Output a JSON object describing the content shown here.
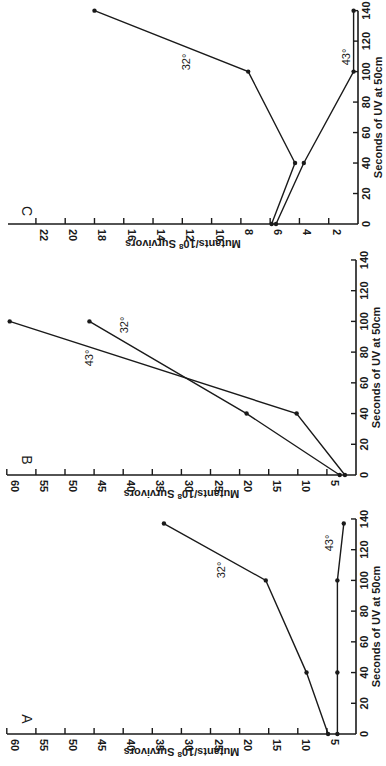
{
  "figure": {
    "orientation": "rotated 90 degrees clockwise",
    "colors": {
      "ink": "#1a1a1a",
      "background": "#ffffff"
    }
  },
  "chart_data": [
    {
      "panel": "A",
      "type": "line",
      "title": "A",
      "xlabel": "Seconds of UV at 50cm",
      "ylabel": "Mutants/10^8 Survivors",
      "ylabel_display": {
        "main": "Mutants/10",
        "sup": "8",
        "rest": " Survivors"
      },
      "xlim": [
        0,
        140
      ],
      "ylim": [
        0,
        60
      ],
      "xticks": [
        0,
        20,
        40,
        60,
        80,
        100,
        120,
        140
      ],
      "yticks": [
        5,
        10,
        15,
        20,
        25,
        30,
        35,
        40,
        45,
        50,
        55,
        60
      ],
      "grid": false,
      "series": [
        {
          "name": "32°",
          "x": [
            0,
            40,
            100,
            137
          ],
          "y": [
            4.8,
            8.5,
            15.5,
            33
          ]
        },
        {
          "name": "43°",
          "x": [
            0,
            40,
            100,
            137
          ],
          "y": [
            3.2,
            3.2,
            3.2,
            2.1
          ]
        }
      ]
    },
    {
      "panel": "B",
      "type": "line",
      "title": "B",
      "xlabel": "Seconds of UV at 50cm",
      "ylabel": "Mutants/10^8 Survivors",
      "ylabel_display": {
        "main": "Mutants/10",
        "sup": "8",
        "rest": " Survivors"
      },
      "xlim": [
        0,
        140
      ],
      "ylim": [
        0,
        60
      ],
      "xticks": [
        0,
        20,
        40,
        60,
        80,
        100,
        120,
        140
      ],
      "yticks": [
        5,
        10,
        15,
        20,
        25,
        30,
        35,
        40,
        45,
        50,
        55,
        60
      ],
      "grid": false,
      "series": [
        {
          "name": "32°",
          "x": [
            0,
            40,
            100
          ],
          "y": [
            2.8,
            18.8,
            45.8
          ]
        },
        {
          "name": "43°",
          "x": [
            0,
            40,
            100
          ],
          "y": [
            1.9,
            10.2,
            59.5
          ]
        }
      ]
    },
    {
      "panel": "C",
      "type": "line",
      "title": "C",
      "xlabel": "Seconds of UV at 50cm",
      "ylabel": "Mutants/10^8 Survivors",
      "ylabel_display": {
        "main": "Mutants/10",
        "sup": "8",
        "rest": " Survivors"
      },
      "xlim": [
        0,
        140
      ],
      "ylim": [
        0,
        24
      ],
      "xticks": [
        0,
        20,
        40,
        60,
        80,
        100,
        120,
        140
      ],
      "yticks": [
        2,
        4,
        6,
        8,
        10,
        12,
        14,
        16,
        18,
        20,
        22
      ],
      "grid": false,
      "series": [
        {
          "name": "32°",
          "x": [
            0,
            40,
            100,
            140
          ],
          "y": [
            5.9,
            4.3,
            7.5,
            18
          ]
        },
        {
          "name": "43°",
          "x": [
            0,
            40,
            100,
            140
          ],
          "y": [
            5.6,
            3.7,
            0.3,
            0.3
          ]
        }
      ]
    }
  ],
  "labels": {
    "panel_a": "A",
    "panel_b": "B",
    "panel_c": "C",
    "x_axis": "Seconds of UV at 50cm",
    "y_axis_main": "Mutants/10",
    "y_axis_sup": "8",
    "y_axis_rest": " Survivors",
    "series_32": "32°",
    "series_43": "43°"
  }
}
